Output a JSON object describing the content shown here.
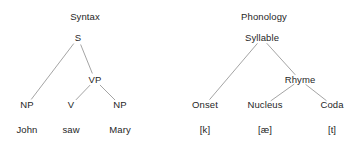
{
  "figure": {
    "background_color": "#ffffff",
    "text_color": "#262626",
    "edge_color": "#9a9a9a",
    "width": 361,
    "height": 147
  },
  "chart_data": {
    "type": "diagram",
    "diagram_type": "linguistic-tree-pair",
    "title": "",
    "trees": [
      {
        "id": "syntax-tree",
        "title": "Syntax",
        "title_pos": [
          85,
          17
        ],
        "root": "S",
        "nodes": [
          {
            "id": "s",
            "label": "S",
            "x": 78,
            "y": 38
          },
          {
            "id": "np1",
            "label": "NP",
            "x": 27,
            "y": 105
          },
          {
            "id": "vp",
            "label": "VP",
            "x": 95,
            "y": 80
          },
          {
            "id": "v",
            "label": "V",
            "x": 71,
            "y": 105
          },
          {
            "id": "np2",
            "label": "NP",
            "x": 120,
            "y": 105
          }
        ],
        "edges": [
          {
            "from": "s",
            "to": "np1"
          },
          {
            "from": "s",
            "to": "vp"
          },
          {
            "from": "vp",
            "to": "v"
          },
          {
            "from": "vp",
            "to": "np2"
          }
        ],
        "terminals": [
          {
            "id": "w1",
            "label": "John",
            "x": 27,
            "y": 130,
            "parent": "np1"
          },
          {
            "id": "w2",
            "label": "saw",
            "x": 71,
            "y": 130,
            "parent": "v"
          },
          {
            "id": "w3",
            "label": "Mary",
            "x": 120,
            "y": 130,
            "parent": "np2"
          }
        ]
      },
      {
        "id": "phonology-tree",
        "title": "Phonology",
        "title_pos": [
          264,
          17
        ],
        "root": "Syllable",
        "nodes": [
          {
            "id": "syl",
            "label": "Syllable",
            "x": 262,
            "y": 38
          },
          {
            "id": "onset",
            "label": "Onset",
            "x": 205,
            "y": 105
          },
          {
            "id": "rhyme",
            "label": "Rhyme",
            "x": 300,
            "y": 80
          },
          {
            "id": "nuc",
            "label": "Nucleus",
            "x": 265,
            "y": 105
          },
          {
            "id": "coda",
            "label": "Coda",
            "x": 332,
            "y": 105
          }
        ],
        "edges": [
          {
            "from": "syl",
            "to": "onset"
          },
          {
            "from": "syl",
            "to": "rhyme"
          },
          {
            "from": "rhyme",
            "to": "nuc"
          },
          {
            "from": "rhyme",
            "to": "coda"
          }
        ],
        "terminals": [
          {
            "id": "p1",
            "label": "[k]",
            "x": 205,
            "y": 130,
            "parent": "onset"
          },
          {
            "id": "p2",
            "label": "[æ]",
            "x": 265,
            "y": 130,
            "parent": "nuc"
          },
          {
            "id": "p3",
            "label": "[t]",
            "x": 332,
            "y": 130,
            "parent": "coda"
          }
        ]
      }
    ]
  }
}
